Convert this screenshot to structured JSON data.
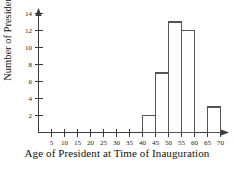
{
  "chart_data": {
    "type": "bar",
    "title": "",
    "subtitle": "",
    "xlabel": "Age of President at Time of Inauguration",
    "ylabel": "Number of Presidents",
    "bin_width": 5,
    "categories": [
      "40-45",
      "45-50",
      "50-55",
      "55-60",
      "60-65",
      "65-70"
    ],
    "bin_starts": [
      40,
      45,
      50,
      55,
      60,
      65
    ],
    "values": [
      2,
      7,
      13,
      12,
      0,
      3
    ],
    "x": [
      40,
      45,
      50,
      55,
      60,
      65
    ],
    "xlim": [
      0,
      72
    ],
    "ylim": [
      0,
      14
    ],
    "x_ticks": [
      5,
      10,
      15,
      20,
      25,
      30,
      35,
      40,
      45,
      50,
      55,
      60,
      65,
      70
    ],
    "x_tick_labels": [
      "5",
      "10",
      "15",
      "20",
      "25",
      "30",
      "35",
      "40",
      "45",
      "50",
      "55",
      "60",
      "65",
      "70"
    ],
    "y_ticks": [
      2,
      4,
      6,
      8,
      10,
      12,
      14
    ],
    "y_tick_labels": [
      "2",
      "4",
      "6",
      "8",
      "10",
      "12",
      "14"
    ],
    "grid": false,
    "legend": false,
    "legend_position": "none",
    "bar_fill_color": "#ffffff",
    "bar_edge_color": "#555555",
    "axis_color": "#3a3a3a",
    "background_color": "#ffffff",
    "annotations": []
  },
  "axes": {
    "x_title": "Age of President at Time of Inauguration",
    "y_title": "Number of Presidents"
  },
  "ticks": {
    "x": [
      "5",
      "10",
      "15",
      "20",
      "25",
      "30",
      "35",
      "40",
      "45",
      "50",
      "55",
      "60",
      "65",
      "70"
    ],
    "y": [
      "2",
      "4",
      "6",
      "8",
      "10",
      "12",
      "14"
    ]
  }
}
